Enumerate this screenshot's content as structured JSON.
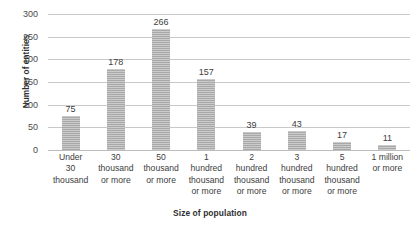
{
  "chart_data": {
    "type": "bar",
    "title": "",
    "xlabel": "Size of population",
    "ylabel": "Number of entities",
    "ylim": [
      0,
      300
    ],
    "ytick_step": 50,
    "yticks": [
      "0",
      "50",
      "100",
      "150",
      "200",
      "250",
      "300"
    ],
    "grid": true,
    "legend": "none",
    "categories": [
      "Under 30 thousand",
      "30 thousand or more",
      "50 thousand or more",
      "1 hundred thousand or more",
      "2 hundred thousand or more",
      "3 hundred thousand or more",
      "5 hundred thousand or more",
      "1 million or more"
    ],
    "category_lines": [
      [
        "Under",
        "30",
        "thousand"
      ],
      [
        "30",
        "thousand",
        "or more"
      ],
      [
        "50",
        "thousand",
        "or more"
      ],
      [
        "1",
        "hundred",
        "thousand",
        "or more"
      ],
      [
        "2",
        "hundred",
        "thousand",
        "or more"
      ],
      [
        "3",
        "hundred",
        "thousand",
        "or more"
      ],
      [
        "5",
        "hundred",
        "thousand",
        "or more"
      ],
      [
        "1 million",
        "or more"
      ]
    ],
    "values": [
      75,
      178,
      266,
      157,
      39,
      43,
      17,
      11
    ],
    "value_labels": [
      "75",
      "178",
      "266",
      "157",
      "39",
      "43",
      "17",
      "11"
    ],
    "colors": {
      "bar": "#b0b0b0",
      "gridline": "#c9c9c9",
      "text": "#3d3d3d",
      "axis_title": "#2f2f2f",
      "background": "#ffffff"
    }
  }
}
